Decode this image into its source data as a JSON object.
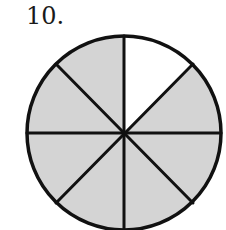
{
  "problem": {
    "number_label": "10."
  },
  "figure": {
    "type": "fraction-circle",
    "total_parts": 8,
    "shaded_parts": 7,
    "unshaded_parts": 1,
    "unshaded_position": "top-right",
    "colors": {
      "shaded": "#d4d4d4",
      "unshaded": "#ffffff",
      "stroke": "#111111"
    }
  }
}
